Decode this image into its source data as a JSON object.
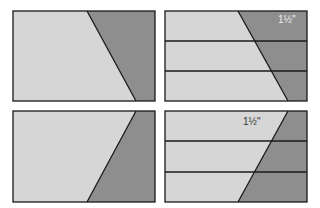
{
  "colors": {
    "light": "#d6d6d6",
    "dark": "#8e8e8e",
    "stroke": "#1a1a1a"
  },
  "panels": [
    {
      "id": "top-left",
      "label": ""
    },
    {
      "id": "top-right",
      "label": "1½\""
    },
    {
      "id": "bottom-left",
      "label": ""
    },
    {
      "id": "bottom-right",
      "label": "1½\""
    }
  ]
}
